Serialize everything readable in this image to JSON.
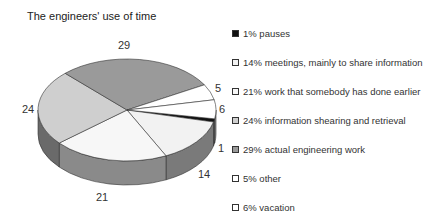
{
  "chart_data": {
    "type": "pie",
    "title": "The engineers' use of time",
    "values": [
      1,
      14,
      21,
      24,
      29,
      5,
      6
    ],
    "slice_labels": [
      "1",
      "14",
      "21",
      "24",
      "29",
      "5",
      "6"
    ],
    "categories": [
      "pauses",
      "meetings, mainly to share information",
      "work that somebody has done earlier",
      "information shearing and retrieval",
      "actual engineering work",
      "other",
      "vacation"
    ],
    "legend": [
      {
        "label": "1% pauses",
        "color": "#111111"
      },
      {
        "label": "14% meetings, mainly to share information",
        "color": "#f2f2f2"
      },
      {
        "label": "21% work that somebody has done earlier",
        "color": "#f7f7f7"
      },
      {
        "label": "24% information shearing and retrieval",
        "color": "#cfcfcf"
      },
      {
        "label": "29% actual engineering work",
        "color": "#9a9a9a"
      },
      {
        "label": "5% other",
        "color": "#ffffff"
      },
      {
        "label": "6% vacation",
        "color": "#ffffff"
      }
    ],
    "legend_position": "right",
    "style": "3d"
  }
}
